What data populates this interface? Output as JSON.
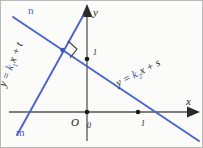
{
  "figure": {
    "colors": {
      "line": "#4a63c8",
      "axis": "#555555",
      "label": "#1a1a1a",
      "line_label": "#4a5fc1",
      "background": "#fbfbfa",
      "border": "#b9b9b9"
    }
  },
  "axes": {
    "x_label": "x",
    "y_label": "y",
    "origin_label": "O",
    "origin_value": "0"
  },
  "ticks": {
    "x_one": "1",
    "y_one": "1"
  },
  "lines": {
    "n": {
      "name": "n",
      "label": "n",
      "equation_parts": {
        "lhs": "y = ",
        "k": "k",
        "k_sub": "2",
        "x": "x + ",
        "c": "s"
      },
      "equation_text": "y = k2x + s"
    },
    "m": {
      "name": "m",
      "label": "m",
      "equation_parts": {
        "lhs": "y = ",
        "k": "k",
        "k_sub": "1",
        "x": "x + ",
        "c": "t"
      },
      "equation_text": "y = k1x + t"
    }
  },
  "markers": {
    "right_angle": "right-angle-mark",
    "intersection": "intersection-point"
  }
}
